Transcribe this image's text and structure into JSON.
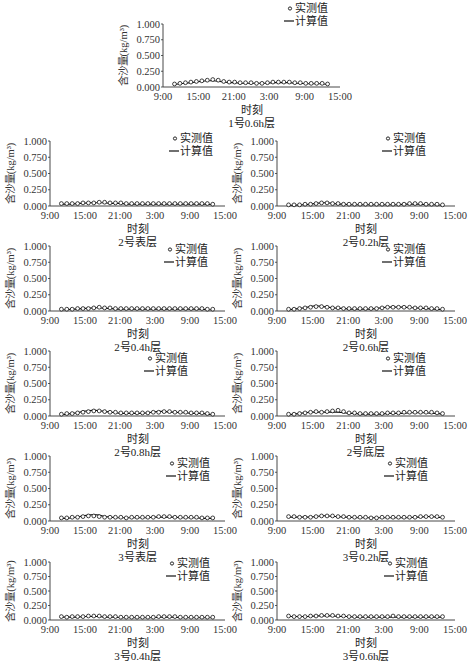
{
  "common": {
    "ylabel": "含沙量(kg/m³)",
    "xlabel": "时刻",
    "yticks": [
      "1.000",
      "0.750",
      "0.500",
      "0.250",
      "0.000"
    ],
    "xticks": [
      "9:00",
      "15:00",
      "21:00",
      "3:00",
      "9:00",
      "15:00"
    ],
    "legend": {
      "measured": "实测值",
      "computed": "计算值"
    }
  },
  "chart_data": [
    {
      "type": "line",
      "title": "1号0.6h层",
      "xlabel": "时刻",
      "ylabel": "含沙量(kg/m³)",
      "ylim": [
        0,
        1
      ],
      "legend_position": "top-right",
      "grid": false,
      "x_ticks": [
        "9:00",
        "15:00",
        "21:00",
        "3:00",
        "9:00",
        "15:00"
      ],
      "series": [
        {
          "name": "实测值",
          "marker": "o",
          "values": [
            0.04,
            0.05,
            0.06,
            0.07,
            0.08,
            0.09,
            0.1,
            0.11,
            0.1,
            0.08,
            0.07,
            0.07,
            0.06,
            0.06,
            0.06,
            0.05,
            0.05,
            0.06,
            0.07,
            0.07,
            0.07,
            0.07,
            0.06,
            0.06,
            0.05,
            0.05,
            0.05,
            0.05,
            0.04
          ]
        },
        {
          "name": "计算值",
          "marker": "line",
          "values": [
            0.04,
            0.05,
            0.06,
            0.07,
            0.08,
            0.09,
            0.1,
            0.1,
            0.09,
            0.08,
            0.07,
            0.07,
            0.06,
            0.06,
            0.06,
            0.06,
            0.06,
            0.06,
            0.07,
            0.07,
            0.07,
            0.07,
            0.06,
            0.06,
            0.05,
            0.05,
            0.05,
            0.05,
            0.04
          ]
        }
      ]
    },
    {
      "type": "line",
      "title": "2号表层",
      "xlabel": "时刻",
      "ylabel": "含沙量(kg/m³)",
      "ylim": [
        0,
        1
      ],
      "legend_position": "top-right",
      "grid": false,
      "x_ticks": [
        "9:00",
        "15:00",
        "21:00",
        "3:00",
        "9:00",
        "15:00"
      ],
      "series": [
        {
          "name": "实测值",
          "marker": "o",
          "values": [
            0.03,
            0.03,
            0.03,
            0.03,
            0.04,
            0.04,
            0.04,
            0.05,
            0.05,
            0.04,
            0.04,
            0.04,
            0.03,
            0.03,
            0.03,
            0.03,
            0.03,
            0.03,
            0.03,
            0.03,
            0.03,
            0.03,
            0.03,
            0.03,
            0.03,
            0.03,
            0.03,
            0.03,
            0.02
          ]
        },
        {
          "name": "计算值",
          "marker": "line",
          "values": [
            0.03,
            0.03,
            0.03,
            0.04,
            0.04,
            0.05,
            0.05,
            0.05,
            0.05,
            0.04,
            0.04,
            0.04,
            0.03,
            0.03,
            0.03,
            0.03,
            0.03,
            0.03,
            0.03,
            0.03,
            0.03,
            0.03,
            0.03,
            0.03,
            0.03,
            0.03,
            0.03,
            0.03,
            0.02
          ]
        }
      ]
    },
    {
      "type": "line",
      "title": "2号0.2h层",
      "xlabel": "时刻",
      "ylabel": "含沙量(kg/m³)",
      "ylim": [
        0,
        1
      ],
      "legend_position": "top-right",
      "grid": false,
      "x_ticks": [
        "9:00",
        "15:00",
        "21:00",
        "3:00",
        "9:00",
        "15:00"
      ],
      "series": [
        {
          "name": "实测值",
          "marker": "o",
          "values": [
            0.01,
            0.01,
            0.01,
            0.02,
            0.02,
            0.03,
            0.04,
            0.04,
            0.03,
            0.03,
            0.02,
            0.02,
            0.02,
            0.02,
            0.02,
            0.02,
            0.02,
            0.02,
            0.02,
            0.02,
            0.02,
            0.02,
            0.03,
            0.03,
            0.03,
            0.02,
            0.02,
            0.02,
            0.01
          ]
        },
        {
          "name": "计算值",
          "marker": "line",
          "values": [
            0.01,
            0.01,
            0.02,
            0.02,
            0.03,
            0.04,
            0.05,
            0.05,
            0.04,
            0.03,
            0.03,
            0.02,
            0.02,
            0.02,
            0.02,
            0.02,
            0.02,
            0.02,
            0.02,
            0.02,
            0.02,
            0.03,
            0.03,
            0.03,
            0.03,
            0.02,
            0.02,
            0.02,
            0.01
          ]
        }
      ]
    },
    {
      "type": "line",
      "title": "2号0.4h层",
      "xlabel": "时刻",
      "ylabel": "含沙量(kg/m³)",
      "ylim": [
        0,
        1
      ],
      "legend_position": "top-right",
      "grid": false,
      "x_ticks": [
        "9:00",
        "15:00",
        "21:00",
        "3:00",
        "9:00",
        "15:00"
      ],
      "series": [
        {
          "name": "实测值",
          "marker": "o",
          "values": [
            0.02,
            0.02,
            0.02,
            0.03,
            0.03,
            0.03,
            0.04,
            0.05,
            0.04,
            0.04,
            0.03,
            0.03,
            0.03,
            0.03,
            0.03,
            0.03,
            0.03,
            0.03,
            0.03,
            0.03,
            0.03,
            0.03,
            0.03,
            0.03,
            0.03,
            0.03,
            0.03,
            0.02,
            0.02
          ]
        },
        {
          "name": "计算值",
          "marker": "line",
          "values": [
            0.02,
            0.02,
            0.03,
            0.03,
            0.04,
            0.04,
            0.05,
            0.05,
            0.04,
            0.04,
            0.03,
            0.03,
            0.03,
            0.03,
            0.03,
            0.03,
            0.03,
            0.03,
            0.03,
            0.03,
            0.03,
            0.03,
            0.03,
            0.03,
            0.03,
            0.03,
            0.03,
            0.02,
            0.02
          ]
        }
      ]
    },
    {
      "type": "line",
      "title": "2号0.6h层",
      "xlabel": "时刻",
      "ylabel": "含沙量(kg/m³)",
      "ylim": [
        0,
        1
      ],
      "legend_position": "top-right",
      "grid": false,
      "x_ticks": [
        "9:00",
        "15:00",
        "21:00",
        "3:00",
        "9:00",
        "15:00"
      ],
      "series": [
        {
          "name": "实测值",
          "marker": "o",
          "values": [
            0.02,
            0.02,
            0.03,
            0.04,
            0.05,
            0.06,
            0.06,
            0.05,
            0.04,
            0.04,
            0.03,
            0.03,
            0.03,
            0.03,
            0.03,
            0.03,
            0.03,
            0.04,
            0.05,
            0.05,
            0.05,
            0.05,
            0.05,
            0.04,
            0.04,
            0.04,
            0.03,
            0.03,
            0.02
          ]
        },
        {
          "name": "计算值",
          "marker": "line",
          "values": [
            0.02,
            0.03,
            0.04,
            0.05,
            0.07,
            0.08,
            0.07,
            0.06,
            0.05,
            0.04,
            0.04,
            0.03,
            0.03,
            0.03,
            0.03,
            0.03,
            0.04,
            0.05,
            0.06,
            0.06,
            0.06,
            0.06,
            0.05,
            0.05,
            0.04,
            0.04,
            0.03,
            0.03,
            0.02
          ]
        }
      ]
    },
    {
      "type": "line",
      "title": "2号0.8h层",
      "xlabel": "时刻",
      "ylabel": "含沙量(kg/m³)",
      "ylim": [
        0,
        1
      ],
      "legend_position": "top-right",
      "grid": false,
      "x_ticks": [
        "9:00",
        "15:00",
        "21:00",
        "3:00",
        "9:00",
        "15:00"
      ],
      "series": [
        {
          "name": "实测值",
          "marker": "o",
          "values": [
            0.02,
            0.03,
            0.03,
            0.04,
            0.05,
            0.06,
            0.07,
            0.07,
            0.06,
            0.05,
            0.05,
            0.04,
            0.04,
            0.04,
            0.04,
            0.04,
            0.04,
            0.05,
            0.05,
            0.06,
            0.06,
            0.05,
            0.05,
            0.05,
            0.04,
            0.04,
            0.04,
            0.03,
            0.02
          ]
        },
        {
          "name": "计算值",
          "marker": "line",
          "values": [
            0.02,
            0.03,
            0.04,
            0.05,
            0.07,
            0.08,
            0.09,
            0.08,
            0.07,
            0.06,
            0.05,
            0.04,
            0.04,
            0.04,
            0.04,
            0.04,
            0.05,
            0.06,
            0.07,
            0.07,
            0.06,
            0.06,
            0.05,
            0.05,
            0.04,
            0.04,
            0.04,
            0.03,
            0.02
          ]
        }
      ]
    },
    {
      "type": "line",
      "title": "2号底层",
      "xlabel": "时刻",
      "ylabel": "含沙量(kg/m³)",
      "ylim": [
        0,
        1
      ],
      "legend_position": "top-right",
      "grid": false,
      "x_ticks": [
        "9:00",
        "15:00",
        "21:00",
        "3:00",
        "9:00",
        "15:00"
      ],
      "series": [
        {
          "name": "实测值",
          "marker": "o",
          "values": [
            0.02,
            0.02,
            0.03,
            0.04,
            0.05,
            0.06,
            0.05,
            0.06,
            0.07,
            0.08,
            0.06,
            0.04,
            0.04,
            0.03,
            0.03,
            0.03,
            0.03,
            0.03,
            0.04,
            0.04,
            0.04,
            0.05,
            0.05,
            0.05,
            0.05,
            0.05,
            0.05,
            0.04,
            0.03
          ]
        },
        {
          "name": "计算值",
          "marker": "line",
          "values": [
            0.02,
            0.03,
            0.04,
            0.05,
            0.06,
            0.06,
            0.06,
            0.06,
            0.06,
            0.06,
            0.05,
            0.04,
            0.04,
            0.03,
            0.03,
            0.03,
            0.03,
            0.03,
            0.04,
            0.04,
            0.04,
            0.04,
            0.05,
            0.05,
            0.05,
            0.05,
            0.04,
            0.04,
            0.03
          ]
        }
      ]
    },
    {
      "type": "line",
      "title": "3号表层",
      "xlabel": "时刻",
      "ylabel": "含沙量(kg/m³)",
      "ylim": [
        0,
        1
      ],
      "legend_position": "top-right",
      "grid": false,
      "x_ticks": [
        "9:00",
        "15:00",
        "21:00",
        "3:00",
        "9:00",
        "15:00"
      ],
      "series": [
        {
          "name": "实测值",
          "marker": "o",
          "values": [
            0.04,
            0.04,
            0.05,
            0.05,
            0.06,
            0.07,
            0.07,
            0.06,
            0.05,
            0.05,
            0.05,
            0.05,
            0.04,
            0.05,
            0.05,
            0.05,
            0.05,
            0.05,
            0.06,
            0.06,
            0.06,
            0.05,
            0.05,
            0.05,
            0.05,
            0.05,
            0.04,
            0.04,
            0.04
          ]
        },
        {
          "name": "计算值",
          "marker": "line",
          "values": [
            0.04,
            0.04,
            0.05,
            0.06,
            0.08,
            0.09,
            0.1,
            0.09,
            0.07,
            0.06,
            0.05,
            0.05,
            0.05,
            0.05,
            0.05,
            0.05,
            0.05,
            0.06,
            0.06,
            0.06,
            0.06,
            0.06,
            0.05,
            0.05,
            0.05,
            0.05,
            0.04,
            0.04,
            0.04
          ]
        }
      ]
    },
    {
      "type": "line",
      "title": "3号0.2h层",
      "xlabel": "时刻",
      "ylabel": "含沙量(kg/m³)",
      "ylim": [
        0,
        1
      ],
      "legend_position": "top-right",
      "grid": false,
      "x_ticks": [
        "9:00",
        "15:00",
        "21:00",
        "3:00",
        "9:00",
        "15:00"
      ],
      "series": [
        {
          "name": "实测值",
          "marker": "o",
          "values": [
            0.06,
            0.06,
            0.05,
            0.05,
            0.05,
            0.06,
            0.07,
            0.07,
            0.07,
            0.06,
            0.06,
            0.05,
            0.05,
            0.05,
            0.05,
            0.04,
            0.04,
            0.05,
            0.05,
            0.05,
            0.05,
            0.05,
            0.05,
            0.05,
            0.06,
            0.06,
            0.06,
            0.06,
            0.05
          ]
        },
        {
          "name": "计算值",
          "marker": "line",
          "values": [
            0.06,
            0.06,
            0.06,
            0.06,
            0.06,
            0.07,
            0.08,
            0.08,
            0.07,
            0.07,
            0.06,
            0.06,
            0.05,
            0.05,
            0.05,
            0.05,
            0.05,
            0.05,
            0.05,
            0.05,
            0.05,
            0.05,
            0.05,
            0.06,
            0.06,
            0.07,
            0.07,
            0.06,
            0.05
          ]
        }
      ]
    },
    {
      "type": "line",
      "title": "3号0.4h层",
      "xlabel": "时刻",
      "ylabel": "含沙量(kg/m³)",
      "ylim": [
        0,
        1
      ],
      "legend_position": "top-right",
      "grid": false,
      "x_ticks": [
        "9:00",
        "15:00",
        "21:00",
        "3:00",
        "9:00",
        "15:00"
      ],
      "series": [
        {
          "name": "实测值",
          "marker": "o",
          "values": [
            0.05,
            0.04,
            0.05,
            0.05,
            0.05,
            0.06,
            0.06,
            0.06,
            0.05,
            0.05,
            0.05,
            0.04,
            0.04,
            0.04,
            0.04,
            0.04,
            0.04,
            0.04,
            0.05,
            0.05,
            0.05,
            0.05,
            0.04,
            0.04,
            0.04,
            0.04,
            0.04,
            0.04,
            0.04
          ]
        },
        {
          "name": "计算值",
          "marker": "line",
          "values": [
            0.05,
            0.05,
            0.05,
            0.05,
            0.06,
            0.06,
            0.06,
            0.06,
            0.05,
            0.05,
            0.05,
            0.04,
            0.04,
            0.04,
            0.04,
            0.04,
            0.04,
            0.04,
            0.05,
            0.05,
            0.05,
            0.05,
            0.04,
            0.04,
            0.04,
            0.04,
            0.04,
            0.04,
            0.04
          ]
        }
      ]
    },
    {
      "type": "line",
      "title": "3号0.6h层",
      "xlabel": "时刻",
      "ylabel": "含沙量(kg/m³)",
      "ylim": [
        0,
        1
      ],
      "legend_position": "top-right",
      "grid": false,
      "x_ticks": [
        "9:00",
        "15:00",
        "21:00",
        "3:00",
        "9:00",
        "15:00"
      ],
      "series": [
        {
          "name": "实测值",
          "marker": "o",
          "values": [
            0.06,
            0.05,
            0.05,
            0.05,
            0.06,
            0.06,
            0.07,
            0.07,
            0.07,
            0.06,
            0.06,
            0.05,
            0.05,
            0.05,
            0.05,
            0.05,
            0.05,
            0.05,
            0.05,
            0.06,
            0.05,
            0.05,
            0.05,
            0.05,
            0.05,
            0.05,
            0.05,
            0.05,
            0.05
          ]
        },
        {
          "name": "计算值",
          "marker": "line",
          "values": [
            0.06,
            0.06,
            0.06,
            0.06,
            0.06,
            0.07,
            0.07,
            0.07,
            0.07,
            0.06,
            0.06,
            0.06,
            0.05,
            0.05,
            0.05,
            0.05,
            0.05,
            0.05,
            0.05,
            0.05,
            0.05,
            0.05,
            0.05,
            0.05,
            0.05,
            0.05,
            0.05,
            0.05,
            0.05
          ]
        }
      ]
    }
  ]
}
